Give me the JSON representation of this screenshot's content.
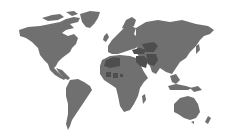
{
  "map": {
    "type": "world-choropleth",
    "background_color": "#ffffff",
    "land_color": "#707070",
    "highlight_color": "#4e4e4e",
    "regions": [
      {
        "name": "north-america",
        "highlighted": false
      },
      {
        "name": "greenland",
        "highlighted": false
      },
      {
        "name": "south-america",
        "highlighted": false
      },
      {
        "name": "europe",
        "highlighted": false
      },
      {
        "name": "africa",
        "highlighted": false
      },
      {
        "name": "asia",
        "highlighted": false
      },
      {
        "name": "australia",
        "highlighted": false
      },
      {
        "name": "new-zealand",
        "highlighted": false
      },
      {
        "name": "indonesia",
        "highlighted": false
      },
      {
        "name": "japan",
        "highlighted": false
      }
    ],
    "highlighted_areas": [
      {
        "name": "north-africa",
        "highlighted": true
      },
      {
        "name": "sahel-west",
        "highlighted": true
      },
      {
        "name": "sahel-central",
        "highlighted": true
      },
      {
        "name": "sahel-east",
        "highlighted": true
      },
      {
        "name": "turkey",
        "highlighted": true
      },
      {
        "name": "middle-east",
        "highlighted": true
      },
      {
        "name": "central-asia",
        "highlighted": true
      },
      {
        "name": "iran-afghanistan-pakistan",
        "highlighted": true
      }
    ]
  }
}
